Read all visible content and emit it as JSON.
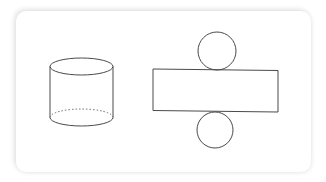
{
  "figure": {
    "cylinder": {
      "label": "cylinder",
      "top_ellipse": {
        "cx": 81.5,
        "cy": 66.5,
        "rx": 31.5,
        "ry": 8.5
      },
      "bottom_ellipse": {
        "cx": 81.5,
        "cy": 117.5,
        "rx": 31.5,
        "ry": 8.5
      },
      "hidden_edge_style": "dotted"
    },
    "net": {
      "label": "net of cylinder",
      "top_circle": {
        "cx": 217,
        "cy": 51,
        "r": 19
      },
      "rectangle": {
        "x1": 153,
        "y1": 69,
        "x2": 278,
        "y2": 111
      },
      "bottom_circle": {
        "cx": 215,
        "cy": 130,
        "r": 18
      }
    },
    "colors": {
      "stroke": "#4a4a4a",
      "background": "#ffffff"
    }
  }
}
